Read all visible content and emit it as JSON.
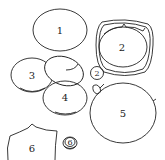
{
  "diagram": {
    "type": "numbered-parts-outline",
    "background": "#ffffff",
    "line_color": "#222222",
    "parts": [
      {
        "id": "part-1",
        "label": "1",
        "shape": "ellipse"
      },
      {
        "id": "part-2",
        "label": "2",
        "shape": "double-ring"
      },
      {
        "id": "part-3",
        "label": "3",
        "shape": "overlapping-ellipses"
      },
      {
        "id": "part-2-small",
        "label": "2",
        "shape": "circled-number"
      },
      {
        "id": "part-4",
        "label": "4",
        "shape": "ellipse"
      },
      {
        "id": "part-5",
        "label": "5",
        "shape": "circle-with-leaf"
      },
      {
        "id": "part-6",
        "label": "6",
        "shape": "shield"
      },
      {
        "id": "part-6-small",
        "label": "6",
        "shape": "circled-coin"
      }
    ]
  }
}
